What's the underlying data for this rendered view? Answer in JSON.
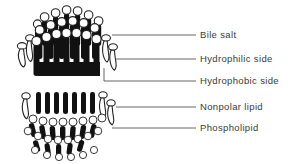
{
  "figure": {
    "background_color": "#ffffff",
    "ink_color": "#111111",
    "text_color": "#3a3a3a",
    "leader_color": "#555555"
  },
  "labels": [
    {
      "id": "bile-salt",
      "text": "Bile salt",
      "text_x": 200,
      "text_y": 38,
      "leader_x1": 112,
      "leader_y1": 35,
      "leader_x2": 196,
      "leader_y2": 35
    },
    {
      "id": "hydrophilic-side",
      "text": "Hydrophilic side",
      "text_x": 200,
      "text_y": 62,
      "leader_x1": 115,
      "leader_y1": 59,
      "leader_x2": 196,
      "leader_y2": 59
    },
    {
      "id": "hydrophobic-side",
      "text": "Hydrophobic side",
      "text_x": 200,
      "text_y": 84,
      "leader_x1": 104,
      "leader_y1": 81,
      "leader_x2": 196,
      "leader_y2": 81
    },
    {
      "id": "nonpolar-lipid",
      "text": "Nonpolar lipid",
      "text_x": 200,
      "text_y": 110,
      "leader_x1": 116,
      "leader_y1": 107,
      "leader_x2": 196,
      "leader_y2": 107
    },
    {
      "id": "phospholipid",
      "text": "Phospholipid",
      "text_x": 200,
      "text_y": 131,
      "leader_x1": 112,
      "leader_y1": 128,
      "leader_x2": 196,
      "leader_y2": 128
    }
  ],
  "structures": [
    {
      "id": "mixed-micelle-upper",
      "name": "Mixed micelle with bile salts",
      "center_x": 68,
      "top_y": 8,
      "bottom_y": 78,
      "half_width": 50
    },
    {
      "id": "inverted-micelle-lower",
      "name": "Inverted lipid micelle",
      "center_x": 68,
      "top_y": 88,
      "bottom_y": 160,
      "half_width": 50
    }
  ],
  "legend_meaning": {
    "filled_black_molecule": "Phospholipid",
    "white_outlined_molecule": "Bile salt",
    "circle_head": "Hydrophilic side",
    "straight_tail": "Hydrophobic side",
    "interior_fill": "Nonpolar lipid"
  }
}
